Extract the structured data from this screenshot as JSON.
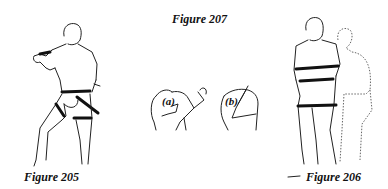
{
  "figures": [
    {
      "id": "205",
      "caption": "Figure 205",
      "description": "man from behind, fist raised, bands at waist and thigh, arrows"
    },
    {
      "id": "206",
      "caption": "Figure 206",
      "description": "man from behind with arms crossed, bands at chest, waist, thigh; dotted outline of turned figure"
    },
    {
      "id": "207",
      "caption": "Figure 207",
      "description": "two shoulder/arm sketches",
      "parts": [
        {
          "label": "(a)"
        },
        {
          "label": "(b)"
        }
      ]
    }
  ],
  "colors": {
    "ink": "#111111",
    "background": "#ffffff"
  }
}
